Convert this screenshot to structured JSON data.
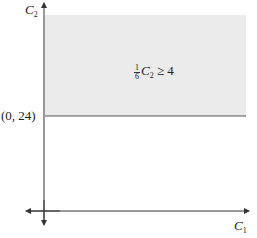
{
  "diagram": {
    "type": "feasible-region-graph",
    "axes": {
      "x_label": "C",
      "x_label_sub": "1",
      "y_label": "C",
      "y_label_sub": "2"
    },
    "point_label": "(0, 24)",
    "region": {
      "inequality_frac_num": "1",
      "inequality_frac_den": "6",
      "inequality_var": "C",
      "inequality_var_sub": "2",
      "inequality_rest": " ≥ 4",
      "fill_color": "#ebebeb",
      "boundary_color": "#555555"
    },
    "axis_color": "#333333"
  }
}
